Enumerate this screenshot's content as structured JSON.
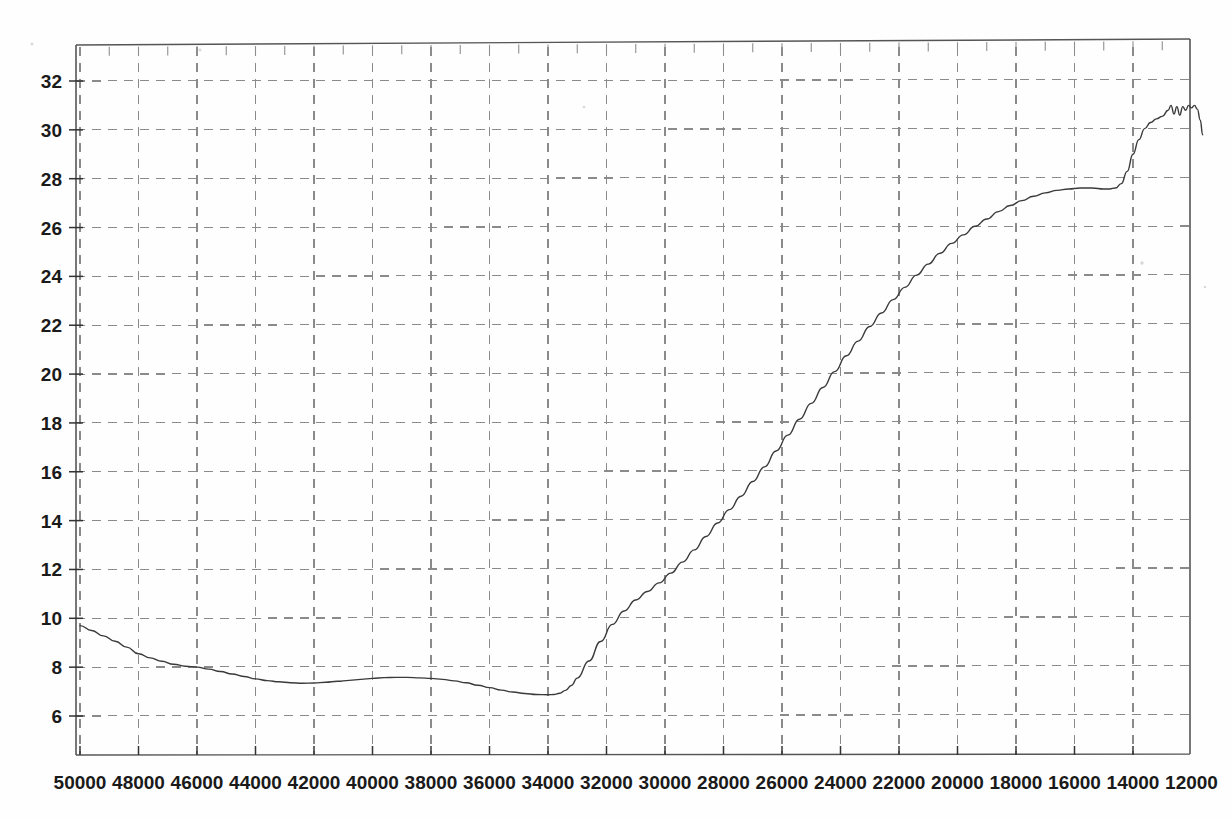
{
  "document": {
    "kind": "scanned-spectrum-chart",
    "background_color": "#fefefe",
    "ink_color": "#3a3a3a"
  },
  "chart_data": {
    "type": "line",
    "title": "",
    "subtitle": "",
    "xlabel": "",
    "ylabel": "",
    "grid": true,
    "grid_style": "dashed",
    "grid_color": "#8a8a8a",
    "legend": null,
    "legend_position": "none",
    "axis_color": "#555555",
    "line_color": "#3a3a3a",
    "line_width": 1.4,
    "x_axis": {
      "direction": "descending",
      "min": 11600,
      "max": 50000,
      "tick_step": 2000,
      "xlim": [
        50000,
        11600
      ],
      "tick_labels": [
        "50000",
        "48000",
        "46000",
        "44000",
        "42000",
        "40000",
        "38000",
        "36000",
        "34000",
        "32000",
        "30000",
        "28000",
        "26000",
        "24000",
        "22000",
        "20000",
        "18000",
        "16000",
        "14000",
        "12000"
      ],
      "tick_values": [
        50000,
        48000,
        46000,
        44000,
        42000,
        40000,
        38000,
        36000,
        34000,
        32000,
        30000,
        28000,
        26000,
        24000,
        22000,
        20000,
        18000,
        16000,
        14000,
        12000
      ],
      "minor_ticks": true
    },
    "y_axis": {
      "min": 5.1,
      "max": 33.0,
      "tick_step": 2,
      "ylim": [
        5.1,
        33.0
      ],
      "tick_labels": [
        "6",
        "8",
        "10",
        "12",
        "14",
        "16",
        "18",
        "20",
        "22",
        "24",
        "26",
        "28",
        "30",
        "32"
      ],
      "tick_values": [
        6,
        8,
        10,
        12,
        14,
        16,
        18,
        20,
        22,
        24,
        26,
        28,
        30,
        32
      ]
    },
    "series": [
      {
        "name": "spectrum",
        "x": [
          50000,
          49600,
          49200,
          48800,
          48400,
          48000,
          47600,
          47200,
          46800,
          46400,
          46000,
          45600,
          45200,
          44800,
          44400,
          44000,
          43600,
          43200,
          42800,
          42400,
          42000,
          41600,
          41200,
          40800,
          40400,
          40000,
          39600,
          39200,
          38800,
          38400,
          38000,
          37600,
          37200,
          36800,
          36400,
          36000,
          35600,
          35200,
          34800,
          34400,
          34000,
          33800,
          33600,
          33400,
          33200,
          33000,
          32600,
          32200,
          31800,
          31400,
          31000,
          30600,
          30200,
          29800,
          29400,
          29000,
          28600,
          28200,
          27800,
          27400,
          27000,
          26600,
          26200,
          25800,
          25400,
          25000,
          24600,
          24200,
          23800,
          23400,
          23000,
          22600,
          22200,
          21800,
          21400,
          21000,
          20600,
          20200,
          19800,
          19400,
          19000,
          18600,
          18200,
          17800,
          17400,
          17000,
          16600,
          16200,
          15800,
          15400,
          15000,
          14800,
          14600,
          14400,
          14200,
          14000,
          13800,
          13600,
          13400,
          13200,
          13000,
          12800,
          12700,
          12600,
          12500,
          12400,
          12300,
          12200,
          12100,
          12000,
          11900,
          11800,
          11700,
          11620
        ],
        "y": [
          9.7,
          9.5,
          9.28,
          9.06,
          8.82,
          8.55,
          8.38,
          8.24,
          8.12,
          8.04,
          8.0,
          7.92,
          7.82,
          7.72,
          7.62,
          7.52,
          7.45,
          7.4,
          7.36,
          7.34,
          7.35,
          7.38,
          7.42,
          7.46,
          7.5,
          7.54,
          7.57,
          7.58,
          7.58,
          7.56,
          7.54,
          7.5,
          7.44,
          7.36,
          7.26,
          7.16,
          7.06,
          6.98,
          6.92,
          6.88,
          6.87,
          6.88,
          6.93,
          7.05,
          7.25,
          7.55,
          8.25,
          9.05,
          9.75,
          10.3,
          10.75,
          11.1,
          11.45,
          11.85,
          12.3,
          12.8,
          13.35,
          13.9,
          14.45,
          15.0,
          15.6,
          16.2,
          16.85,
          17.5,
          18.15,
          18.8,
          19.45,
          20.1,
          20.75,
          21.35,
          21.95,
          22.5,
          23.05,
          23.55,
          24.05,
          24.5,
          24.95,
          25.35,
          25.7,
          26.05,
          26.35,
          26.65,
          26.9,
          27.1,
          27.28,
          27.42,
          27.52,
          27.58,
          27.62,
          27.62,
          27.58,
          27.58,
          27.62,
          27.8,
          28.3,
          29.0,
          29.6,
          30.05,
          30.3,
          30.45,
          30.55,
          30.8,
          31.0,
          30.65,
          30.95,
          30.6,
          30.95,
          30.8,
          31.0,
          30.9,
          31.0,
          30.85,
          30.4,
          29.8
        ]
      }
    ],
    "annotations": [
      {
        "label": "baseline-start",
        "x": 50000,
        "y": 9.7
      },
      {
        "label": "local-dip",
        "x": 42400,
        "y": 7.34
      },
      {
        "label": "local-bump",
        "x": 39200,
        "y": 7.58
      },
      {
        "label": "global-minimum",
        "x": 34000,
        "y": 6.87
      },
      {
        "label": "plateau",
        "x": 15600,
        "y": 27.6
      },
      {
        "label": "noisy-peak",
        "x": 12200,
        "y": 31.0
      },
      {
        "label": "end-drop",
        "x": 11620,
        "y": 29.8
      }
    ]
  },
  "geometry": {
    "plot_left": 76,
    "plot_right": 1190,
    "plot_top": 45,
    "plot_bottom": 755,
    "x_at_50000": 80,
    "px_per_2000_x": 58.5,
    "y_at_32": 81,
    "y_at_6": 716
  }
}
